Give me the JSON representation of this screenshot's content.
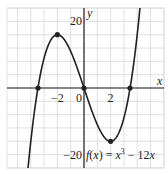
{
  "chart_data": {
    "type": "line",
    "title": "",
    "function_label": "f(x) = x^3 − 12x",
    "function_label_parts": {
      "f": "f",
      "open": "(",
      "x1": "x",
      "close": ") = ",
      "x2": "x",
      "exp": "3",
      "rest": " − 12",
      "x3": "x"
    },
    "xlabel": "x",
    "ylabel": "y",
    "xlim": [
      -6,
      6
    ],
    "ylim": [
      -24,
      24
    ],
    "grid": true,
    "grid_step": {
      "x": 1,
      "y": 4
    },
    "x_tick_labels": [
      {
        "value": -2,
        "label": "−2"
      },
      {
        "value": 0,
        "label": "0"
      },
      {
        "value": 2,
        "label": "2"
      }
    ],
    "y_tick_labels": [
      {
        "value": 20,
        "label": "20"
      },
      {
        "value": -20,
        "label": "−20"
      }
    ],
    "series": [
      {
        "name": "f(x) = x^3 - 12x",
        "x": [
          -4.6,
          -4,
          -3.46,
          -3,
          -2,
          -1,
          0,
          1,
          2,
          3,
          3.46,
          4,
          4.6
        ],
        "y": [
          -42.1,
          -16,
          0,
          9,
          16,
          11,
          0,
          -11,
          -16,
          -9,
          0,
          16,
          42.1
        ]
      }
    ],
    "marked_points": [
      {
        "x": -3.46,
        "y": 0,
        "note": "root -2√3"
      },
      {
        "x": -2,
        "y": 16,
        "note": "local maximum"
      },
      {
        "x": 0,
        "y": 0,
        "note": "root / origin"
      },
      {
        "x": 2,
        "y": -16,
        "note": "local minimum"
      },
      {
        "x": 3.46,
        "y": 0,
        "note": "root 2√3"
      }
    ]
  }
}
